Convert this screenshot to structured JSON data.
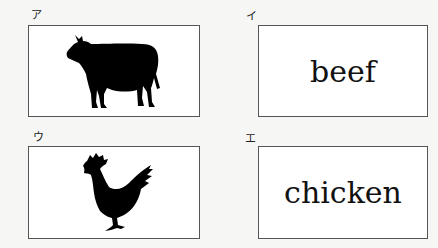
{
  "cards": [
    {
      "label": "ア",
      "type": "image",
      "icon": "cow-silhouette-icon"
    },
    {
      "label": "イ",
      "type": "word",
      "text": "beef"
    },
    {
      "label": "ウ",
      "type": "image",
      "icon": "rooster-silhouette-icon"
    },
    {
      "label": "エ",
      "type": "word",
      "text": "chicken"
    }
  ],
  "colors": {
    "border": "#555555",
    "ink": "#111111",
    "paper": "#f6f6f4"
  }
}
